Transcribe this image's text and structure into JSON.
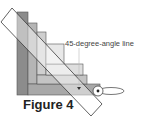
{
  "diagram": {
    "annotation": "45-degree-angle line",
    "caption": "Figure 4",
    "colors": {
      "strip_dark": "#8c8c8c",
      "strip_mid": "#b0b0b0",
      "strip_light": "#d4d4d4",
      "strip_lighter": "#e4e4e4",
      "ruler_fill": "#ffffff",
      "outline": "#3a3a3a"
    },
    "elements": [
      "stepped fabric strips",
      "45-degree ruler",
      "leader line with arrow",
      "rotary cutter / pin loop"
    ]
  }
}
